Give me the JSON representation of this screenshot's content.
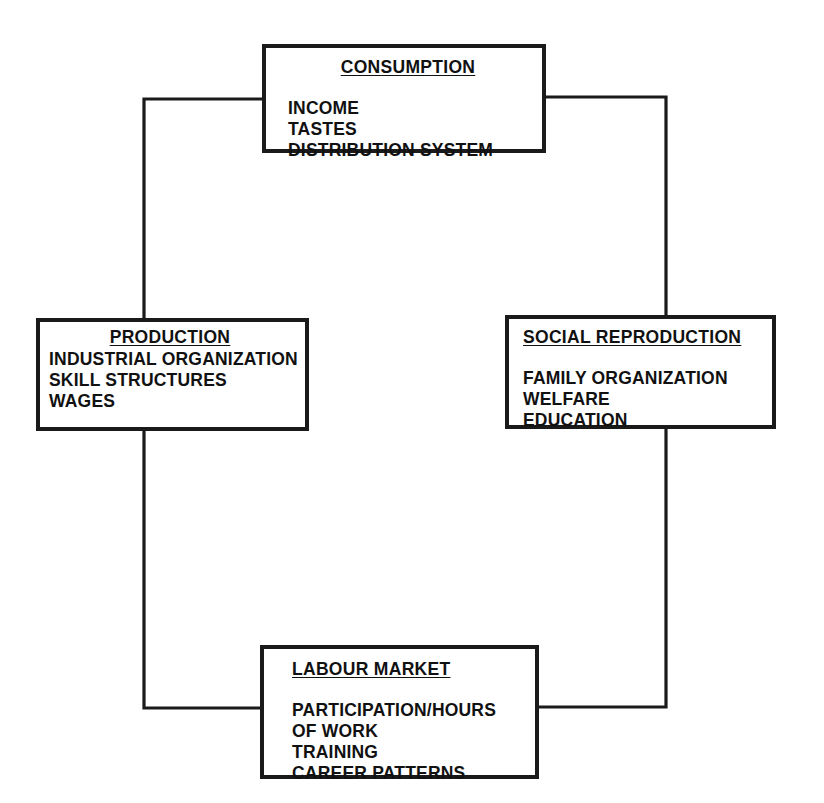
{
  "diagram": {
    "line_color": "#1a1a1a",
    "box_border_color": "#1a1a1a",
    "background_color": "#ffffff",
    "nodes": [
      {
        "id": "consumption",
        "title": "CONSUMPTION",
        "title_align": "center",
        "items": [
          "INCOME",
          "TASTES",
          "DISTRIBUTION SYSTEM"
        ],
        "spacer_after_title": "large"
      },
      {
        "id": "production",
        "title": "PRODUCTION",
        "title_align": "center",
        "items": [
          "INDUSTRIAL ORGANIZATION",
          "SKILL STRUCTURES",
          "WAGES"
        ],
        "spacer_after_title": "small"
      },
      {
        "id": "social_reproduction",
        "title": "SOCIAL REPRODUCTION",
        "title_align": "left",
        "items": [
          "FAMILY ORGANIZATION",
          "WELFARE",
          "EDUCATION"
        ],
        "spacer_after_title": "large"
      },
      {
        "id": "labour_market",
        "title": "LABOUR MARKET",
        "title_align": "left",
        "items": [
          "PARTICIPATION/HOURS",
          "OF WORK",
          "TRAINING",
          "CAREER PATTERNS"
        ],
        "spacer_after_title": "large"
      }
    ],
    "connectors": [
      {
        "id": "left-loop",
        "from": "consumption",
        "to": "labour_market",
        "via": [
          "production"
        ],
        "path": "M 546 99 L 144 99 L 144 318 M 144 431 L 144 708 L 260 708"
      },
      {
        "id": "right-loop",
        "from": "consumption",
        "to": "labour_market",
        "via": [
          "social_reproduction"
        ],
        "path": "M 545 97 L 666 97 L 666 315 M 666 429 L 666 707 L 538 707"
      }
    ]
  }
}
